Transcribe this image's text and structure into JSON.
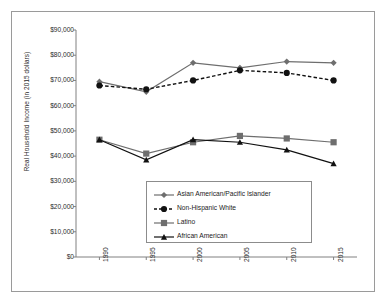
{
  "chart_data": {
    "type": "line",
    "title": "",
    "xlabel": "",
    "ylabel": "Real Household Income (in 2015 dollars)",
    "categories": [
      "1990",
      "1995",
      "2000",
      "2005",
      "2010",
      "2015"
    ],
    "x": [
      1990,
      1995,
      2000,
      2005,
      2010,
      2015
    ],
    "ylim": [
      0,
      90000
    ],
    "ytick_labels": [
      "$0",
      "$10,000",
      "$20,000",
      "$30,000",
      "$40,000",
      "$50,000",
      "$60,000",
      "$70,000",
      "$80,000",
      "$90,000"
    ],
    "ytick_values": [
      0,
      10000,
      20000,
      30000,
      40000,
      50000,
      60000,
      70000,
      80000,
      90000
    ],
    "grid": false,
    "legend_position": "center",
    "series": [
      {
        "name": "Asian American/Pacific Islander",
        "marker": "diamond",
        "color": "#6e6e6e",
        "line_style": "solid",
        "values": [
          69500,
          65500,
          77000,
          75000,
          77500,
          77000
        ]
      },
      {
        "name": "Non-Hispanic White",
        "marker": "circle",
        "color": "#111111",
        "line_style": "dashed",
        "values": [
          68000,
          66500,
          70000,
          74000,
          73000,
          70000
        ]
      },
      {
        "name": "Latino",
        "marker": "square",
        "color": "#6e6e6e",
        "line_style": "solid",
        "values": [
          46500,
          41000,
          45500,
          48000,
          47000,
          45500
        ]
      },
      {
        "name": "African American",
        "marker": "triangle",
        "color": "#111111",
        "line_style": "solid",
        "values": [
          46500,
          38500,
          46500,
          45500,
          42500,
          37000
        ]
      }
    ]
  },
  "legend": {
    "items": [
      {
        "label": "Asian American/Pacific Islander"
      },
      {
        "label": "Non-Hispanic White"
      },
      {
        "label": "Latino"
      },
      {
        "label": "African American"
      }
    ]
  }
}
